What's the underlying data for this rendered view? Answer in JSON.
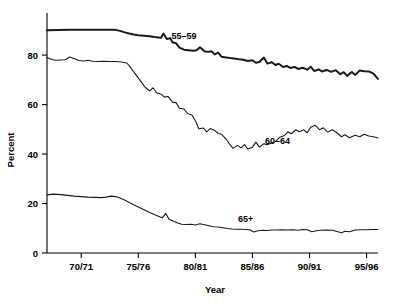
{
  "chart_data": {
    "type": "line",
    "title": "",
    "subtitle": "",
    "xlabel": "Year",
    "ylabel": "Percent",
    "grid": false,
    "legend_position": "inline-annotations",
    "xlim": [
      1967,
      1996
    ],
    "ylim": [
      0,
      95
    ],
    "yticks": [
      0,
      20,
      40,
      60,
      80
    ],
    "ytick_labels": [
      "0",
      "20",
      "40",
      "60",
      "80"
    ],
    "xticks": [
      1970,
      1975,
      1980,
      1985,
      1990,
      1995
    ],
    "xtick_labels": [
      "70/71",
      "75/76",
      "80/81",
      "85/86",
      "90/91",
      "95/96"
    ],
    "annotations": [
      {
        "text": "55–59",
        "x": 1979.0,
        "y": 86.5
      },
      {
        "text": "60–64",
        "x": 1987.2,
        "y": 44.0
      },
      {
        "text": "65+",
        "x": 1984.4,
        "y": 12.5
      }
    ],
    "x": [
      1967,
      1968,
      1969,
      1970,
      1971,
      1972,
      1973,
      1974,
      1975,
      1976,
      1977,
      1978,
      1979,
      1980,
      1981,
      1982,
      1983,
      1984,
      1985,
      1986,
      1987,
      1988,
      1989,
      1990,
      1991,
      1992,
      1993,
      1994,
      1995,
      1996
    ],
    "series": [
      {
        "name": "55–59",
        "style": "thick",
        "stroke_width": 2.0,
        "color": "#1a1a1a",
        "values": [
          90.0,
          90.2,
          90.0,
          90.2,
          90.3,
          90.2,
          90.2,
          89.6,
          88.7,
          87.9,
          87.5,
          85.2,
          82.5,
          81.0,
          80.8,
          79.3,
          78.5,
          77.9,
          77.5,
          76.5,
          75.6,
          75.2,
          74.6,
          74.0,
          73.8,
          73.8,
          72.8,
          73.5,
          72.8,
          70.4
        ]
      },
      {
        "name": "60–64",
        "style": "thin",
        "stroke_width": 1.1,
        "color": "#1a1a1a",
        "values": [
          79.0,
          78.0,
          78.3,
          77.8,
          77.4,
          77.5,
          77.4,
          77.3,
          76.5,
          71.0,
          65.5,
          62.0,
          58.0,
          53.0,
          50.3,
          48.5,
          45.0,
          42.5,
          42.8,
          44.0,
          45.0,
          47.5,
          49.5,
          50.0,
          49.0,
          50.5,
          48.5,
          47.0,
          47.5,
          46.5
        ]
      },
      {
        "name": "65+",
        "style": "thin",
        "stroke_width": 1.1,
        "color": "#1a1a1a",
        "values": [
          23.5,
          23.7,
          23.3,
          22.8,
          22.5,
          22.3,
          22.5,
          21.8,
          20.0,
          18.0,
          16.0,
          14.5,
          12.5,
          11.5,
          11.0,
          10.8,
          10.2,
          9.7,
          9.5,
          9.0,
          9.3,
          9.3,
          9.4,
          9.3,
          9.0,
          9.2,
          8.6,
          9.2,
          9.4,
          9.5
        ]
      }
    ],
    "series_fine": {
      "55–59": [
        [
          1967.0,
          90.0
        ],
        [
          1968.0,
          90.1
        ],
        [
          1969.0,
          90.2
        ],
        [
          1970.0,
          90.2
        ],
        [
          1970.5,
          90.3
        ],
        [
          1971.0,
          90.3
        ],
        [
          1971.5,
          90.2
        ],
        [
          1972.0,
          90.3
        ],
        [
          1972.5,
          90.2
        ],
        [
          1973.0,
          90.2
        ],
        [
          1973.4,
          89.8
        ],
        [
          1973.8,
          89.2
        ],
        [
          1974.2,
          88.7
        ],
        [
          1974.6,
          88.3
        ],
        [
          1975.0,
          88.0
        ],
        [
          1975.5,
          87.8
        ],
        [
          1976.0,
          87.6
        ],
        [
          1976.4,
          87.3
        ],
        [
          1976.8,
          87.1
        ],
        [
          1977.0,
          87.0
        ],
        [
          1977.2,
          88.7
        ],
        [
          1977.5,
          86.5
        ],
        [
          1977.8,
          86.8
        ],
        [
          1978.0,
          85.2
        ],
        [
          1978.3,
          84.8
        ],
        [
          1978.6,
          83.0
        ],
        [
          1979.0,
          82.2
        ],
        [
          1979.4,
          82.0
        ],
        [
          1979.8,
          81.8
        ],
        [
          1980.1,
          82.0
        ],
        [
          1980.4,
          83.2
        ],
        [
          1980.8,
          81.6
        ],
        [
          1981.1,
          81.3
        ],
        [
          1981.4,
          81.6
        ],
        [
          1981.7,
          80.3
        ],
        [
          1982.0,
          81.0
        ],
        [
          1982.3,
          79.3
        ],
        [
          1982.7,
          79.0
        ],
        [
          1983.0,
          78.8
        ],
        [
          1983.4,
          78.6
        ],
        [
          1983.8,
          78.3
        ],
        [
          1984.2,
          78.1
        ],
        [
          1984.6,
          77.6
        ],
        [
          1985.0,
          77.9
        ],
        [
          1985.3,
          76.9
        ],
        [
          1985.6,
          77.2
        ],
        [
          1986.0,
          79.0
        ],
        [
          1986.3,
          76.6
        ],
        [
          1986.7,
          77.1
        ],
        [
          1987.0,
          76.0
        ],
        [
          1987.3,
          76.5
        ],
        [
          1987.7,
          75.2
        ],
        [
          1988.0,
          75.6
        ],
        [
          1988.3,
          74.8
        ],
        [
          1988.7,
          75.2
        ],
        [
          1989.0,
          74.4
        ],
        [
          1989.4,
          74.9
        ],
        [
          1989.8,
          74.1
        ],
        [
          1990.1,
          75.3
        ],
        [
          1990.4,
          73.6
        ],
        [
          1990.8,
          74.2
        ],
        [
          1991.1,
          73.4
        ],
        [
          1991.5,
          74.0
        ],
        [
          1991.9,
          73.2
        ],
        [
          1992.3,
          73.9
        ],
        [
          1992.7,
          72.3
        ],
        [
          1993.0,
          73.1
        ],
        [
          1993.3,
          71.6
        ],
        [
          1993.7,
          73.2
        ],
        [
          1994.0,
          72.0
        ],
        [
          1994.4,
          73.8
        ],
        [
          1994.8,
          73.5
        ],
        [
          1995.2,
          73.4
        ],
        [
          1995.6,
          72.5
        ],
        [
          1996.0,
          70.4
        ]
      ],
      "60–64": [
        [
          1967.0,
          79.0
        ],
        [
          1967.4,
          78.2
        ],
        [
          1967.8,
          77.9
        ],
        [
          1968.2,
          78.0
        ],
        [
          1968.6,
          78.1
        ],
        [
          1969.0,
          79.2
        ],
        [
          1969.4,
          78.5
        ],
        [
          1969.8,
          77.8
        ],
        [
          1970.2,
          77.6
        ],
        [
          1970.6,
          77.9
        ],
        [
          1971.0,
          77.5
        ],
        [
          1971.5,
          77.4
        ],
        [
          1972.0,
          77.5
        ],
        [
          1972.5,
          77.4
        ],
        [
          1973.0,
          77.4
        ],
        [
          1973.5,
          77.2
        ],
        [
          1974.0,
          76.8
        ],
        [
          1974.4,
          74.5
        ],
        [
          1974.8,
          72.0
        ],
        [
          1975.2,
          69.5
        ],
        [
          1975.6,
          67.0
        ],
        [
          1976.0,
          65.5
        ],
        [
          1976.3,
          66.8
        ],
        [
          1976.6,
          64.8
        ],
        [
          1977.0,
          64.2
        ],
        [
          1977.3,
          63.0
        ],
        [
          1977.6,
          63.3
        ],
        [
          1978.0,
          61.0
        ],
        [
          1978.3,
          60.8
        ],
        [
          1978.6,
          58.5
        ],
        [
          1979.0,
          58.2
        ],
        [
          1979.3,
          56.4
        ],
        [
          1979.7,
          55.8
        ],
        [
          1980.0,
          53.5
        ],
        [
          1980.3,
          50.2
        ],
        [
          1980.7,
          50.5
        ],
        [
          1981.0,
          49.0
        ],
        [
          1981.3,
          50.3
        ],
        [
          1981.7,
          49.5
        ],
        [
          1982.0,
          48.3
        ],
        [
          1982.3,
          48.0
        ],
        [
          1982.7,
          46.0
        ],
        [
          1983.0,
          44.0
        ],
        [
          1983.3,
          42.3
        ],
        [
          1983.7,
          43.5
        ],
        [
          1984.0,
          42.5
        ],
        [
          1984.3,
          43.8
        ],
        [
          1984.6,
          42.0
        ],
        [
          1985.0,
          42.8
        ],
        [
          1985.3,
          44.8
        ],
        [
          1985.6,
          42.8
        ],
        [
          1986.0,
          44.2
        ],
        [
          1986.3,
          43.8
        ],
        [
          1986.7,
          44.6
        ],
        [
          1987.0,
          45.0
        ],
        [
          1987.4,
          46.8
        ],
        [
          1987.8,
          47.5
        ],
        [
          1988.1,
          49.0
        ],
        [
          1988.4,
          48.2
        ],
        [
          1988.8,
          49.8
        ],
        [
          1989.1,
          49.0
        ],
        [
          1989.5,
          49.8
        ],
        [
          1989.8,
          48.6
        ],
        [
          1990.1,
          50.8
        ],
        [
          1990.5,
          51.6
        ],
        [
          1990.9,
          49.8
        ],
        [
          1991.2,
          50.6
        ],
        [
          1991.6,
          48.9
        ],
        [
          1992.0,
          49.8
        ],
        [
          1992.4,
          48.6
        ],
        [
          1992.8,
          47.0
        ],
        [
          1993.1,
          47.8
        ],
        [
          1993.5,
          46.6
        ],
        [
          1994.0,
          47.6
        ],
        [
          1994.4,
          47.0
        ],
        [
          1994.8,
          48.0
        ],
        [
          1995.2,
          47.3
        ],
        [
          1995.6,
          47.0
        ],
        [
          1996.0,
          46.5
        ]
      ],
      "65+": [
        [
          1967.0,
          23.5
        ],
        [
          1967.6,
          23.8
        ],
        [
          1968.2,
          23.6
        ],
        [
          1968.8,
          23.3
        ],
        [
          1969.4,
          23.0
        ],
        [
          1970.0,
          22.8
        ],
        [
          1970.6,
          22.6
        ],
        [
          1971.2,
          22.5
        ],
        [
          1971.8,
          22.4
        ],
        [
          1972.2,
          22.6
        ],
        [
          1972.6,
          23.0
        ],
        [
          1973.0,
          22.8
        ],
        [
          1973.4,
          22.2
        ],
        [
          1973.8,
          21.4
        ],
        [
          1974.2,
          20.4
        ],
        [
          1974.6,
          19.5
        ],
        [
          1975.0,
          18.6
        ],
        [
          1975.5,
          17.5
        ],
        [
          1976.0,
          16.4
        ],
        [
          1976.4,
          15.6
        ],
        [
          1976.8,
          14.8
        ],
        [
          1977.1,
          14.2
        ],
        [
          1977.4,
          16.0
        ],
        [
          1977.7,
          13.6
        ],
        [
          1978.0,
          13.0
        ],
        [
          1978.4,
          12.2
        ],
        [
          1978.8,
          11.6
        ],
        [
          1979.2,
          11.5
        ],
        [
          1979.6,
          11.6
        ],
        [
          1980.0,
          11.3
        ],
        [
          1980.4,
          11.8
        ],
        [
          1980.8,
          11.4
        ],
        [
          1981.2,
          11.0
        ],
        [
          1981.6,
          10.6
        ],
        [
          1982.0,
          10.5
        ],
        [
          1982.4,
          10.2
        ],
        [
          1982.8,
          9.9
        ],
        [
          1983.2,
          9.7
        ],
        [
          1983.6,
          9.6
        ],
        [
          1984.0,
          9.6
        ],
        [
          1984.4,
          9.5
        ],
        [
          1984.8,
          9.4
        ],
        [
          1985.1,
          8.5
        ],
        [
          1985.5,
          9.0
        ],
        [
          1985.9,
          9.2
        ],
        [
          1986.3,
          9.1
        ],
        [
          1986.7,
          9.3
        ],
        [
          1987.1,
          9.3
        ],
        [
          1987.6,
          9.4
        ],
        [
          1988.0,
          9.3
        ],
        [
          1988.5,
          9.4
        ],
        [
          1989.0,
          9.2
        ],
        [
          1989.4,
          9.5
        ],
        [
          1989.8,
          9.4
        ],
        [
          1990.2,
          8.6
        ],
        [
          1990.6,
          9.0
        ],
        [
          1991.0,
          9.2
        ],
        [
          1991.5,
          9.3
        ],
        [
          1992.0,
          9.2
        ],
        [
          1992.4,
          8.7
        ],
        [
          1992.8,
          8.2
        ],
        [
          1993.1,
          8.8
        ],
        [
          1993.5,
          8.6
        ],
        [
          1994.0,
          9.3
        ],
        [
          1994.5,
          9.4
        ],
        [
          1995.0,
          9.4
        ],
        [
          1995.5,
          9.5
        ],
        [
          1996.0,
          9.5
        ]
      ]
    }
  },
  "axes": {
    "ylabel": "Percent",
    "xlabel": "Year"
  }
}
